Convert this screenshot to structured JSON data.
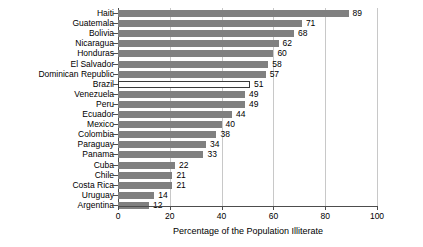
{
  "chart_data": {
    "type": "bar",
    "orientation": "horizontal",
    "title": "",
    "xlabel": "Percentage of the Population Illiterate",
    "ylabel": "",
    "xlim": [
      0,
      100
    ],
    "xticks": [
      0,
      20,
      40,
      60,
      80,
      100
    ],
    "grid": "vertical",
    "legend": null,
    "highlight_category": "Brazil",
    "colors": {
      "bar": "#808080",
      "highlight_fill": "#ffffff",
      "highlight_border": "#3a3a3a",
      "grid": "#c8c8c8",
      "axis": "#4d4d4d",
      "text": "#000000"
    },
    "categories": [
      "Haiti",
      "Guatemala",
      "Bolivia",
      "Nicaragua",
      "Honduras",
      "El Salvador",
      "Dominican Republic",
      "Brazil",
      "Venezuela",
      "Peru",
      "Ecuador",
      "Mexico",
      "Colombia",
      "Paraguay",
      "Panama",
      "Cuba",
      "Chile",
      "Costa Rica",
      "Uruguay",
      "Argentina"
    ],
    "values": [
      89,
      71,
      68,
      62,
      60,
      58,
      57,
      51,
      49,
      49,
      44,
      40,
      38,
      34,
      33,
      22,
      21,
      21,
      14,
      12
    ],
    "value_labels": [
      "89",
      "71",
      "68",
      "62",
      "60",
      "58",
      "57",
      "51",
      "49",
      "49",
      "44",
      "40",
      "38",
      "34",
      "33",
      "22",
      "21",
      "21",
      "14",
      "12"
    ],
    "xtick_labels": [
      "0",
      "20",
      "40",
      "60",
      "80",
      "100"
    ]
  }
}
